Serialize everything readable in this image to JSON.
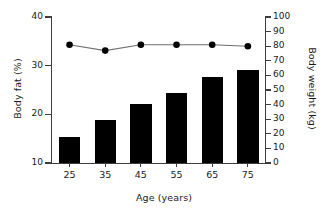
{
  "chart_data": {
    "type": "bar",
    "title": "",
    "categories": [
      "25",
      "35",
      "45",
      "55",
      "65",
      "75"
    ],
    "xlabel": "Age (years)",
    "ylabel": "Body fat (%)",
    "ylabel_right": "Body weight (kg)",
    "ylim": [
      10,
      40
    ],
    "ylim_right": [
      0,
      100
    ],
    "yticks": [
      10,
      20,
      30,
      40
    ],
    "yticks_right": [
      0,
      10,
      20,
      30,
      40,
      50,
      60,
      70,
      80,
      90,
      100
    ],
    "grid": false,
    "legend": null,
    "series": [
      {
        "name": "Body fat (%)",
        "type": "bar",
        "axis": "left",
        "color": "#000000",
        "values": [
          15.3,
          18.8,
          22.1,
          24.4,
          27.7,
          29.1
        ]
      },
      {
        "name": "Body weight (kg)",
        "type": "line",
        "axis": "right",
        "color": "#000000",
        "marker": "circle",
        "values": [
          81,
          77,
          81,
          81,
          81,
          80
        ]
      }
    ]
  },
  "axes": {
    "left_title": "Body fat (%)",
    "right_title": "Body weight (kg)",
    "x_title": "Age (years)",
    "left_ticks": [
      "40",
      "30",
      "20",
      "10"
    ],
    "right_ticks": [
      "100",
      "90",
      "80",
      "70",
      "60",
      "50",
      "40",
      "30",
      "20",
      "10",
      "0"
    ],
    "x_ticks": [
      "25",
      "35",
      "45",
      "55",
      "65",
      "75"
    ]
  }
}
